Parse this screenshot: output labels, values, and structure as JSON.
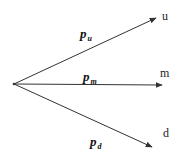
{
  "diagram": {
    "type": "trinomial-branch",
    "origin": {
      "x": 14,
      "y": 84
    },
    "colors": {
      "line": "#333333",
      "text": "#111111",
      "background": "#ffffff"
    },
    "branches": [
      {
        "id": "up",
        "end": {
          "x": 156,
          "y": 18
        },
        "prob_symbol": "p",
        "prob_subscript": "u",
        "prob_pos": {
          "x": 80,
          "y": 38
        },
        "node_label": "u",
        "node_pos": {
          "x": 162,
          "y": 20
        }
      },
      {
        "id": "middle",
        "end": {
          "x": 162,
          "y": 85
        },
        "prob_symbol": "p",
        "prob_subscript": "m",
        "prob_pos": {
          "x": 83,
          "y": 81
        },
        "node_label": "m",
        "node_pos": {
          "x": 162,
          "y": 77
        }
      },
      {
        "id": "down",
        "end": {
          "x": 152,
          "y": 147
        },
        "prob_symbol": "p",
        "prob_subscript": "d",
        "prob_pos": {
          "x": 90,
          "y": 146
        },
        "node_label": "d",
        "node_pos": {
          "x": 163,
          "y": 137
        }
      }
    ]
  }
}
